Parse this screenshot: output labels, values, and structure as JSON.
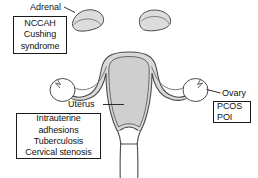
{
  "diagram": {
    "colors": {
      "outline": "#4a4a4a",
      "organ_fill": "#d9d9d9",
      "cavity_fill": "#cfcfcf",
      "adrenal_fill": "#dcdcdc",
      "background": "#ffffff",
      "box_border": "#1a1a1a",
      "text": "#111111"
    },
    "labels": {
      "adrenal": "Adrenal",
      "uterus": "Uterus",
      "ovary": "Ovary"
    },
    "callouts": {
      "adrenal": {
        "site": "Adrenal",
        "lines": [
          "NCCAH",
          "Cushing",
          "syndrome"
        ]
      },
      "uterus": {
        "site": "Uterus",
        "lines": [
          "Intrauterine",
          "adhesions",
          "Tuberculosis",
          "Cervical stenosis"
        ]
      },
      "ovary": {
        "site": "Ovary",
        "lines": [
          "PCOS",
          "POI"
        ]
      }
    },
    "structures": [
      "left-adrenal-gland",
      "right-adrenal-gland",
      "uterus-body",
      "uterine-cavity",
      "left-fallopian-tube",
      "right-fallopian-tube",
      "left-ovary",
      "right-ovary",
      "cervix",
      "vagina"
    ]
  }
}
